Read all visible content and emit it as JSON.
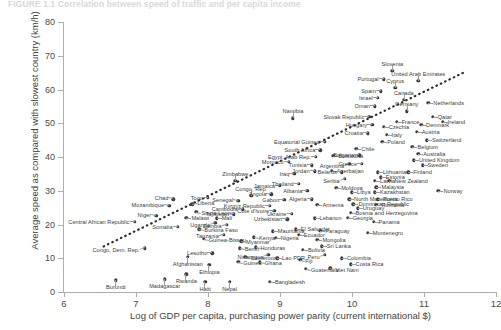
{
  "figure": {
    "title": "FIGURE 1.1  Correlation between speed of traffic and per capita income",
    "xlabel": "Log of GDP per capita, purchasing power parity (current international $)",
    "ylabel": "Average speed as compared with slowest country (km/h)"
  },
  "chart_data": {
    "type": "scatter",
    "title": "FIGURE 1.1  Correlation between speed of traffic and per capita income",
    "xlabel": "Log of GDP per capita, purchasing power parity (current international $)",
    "ylabel": "Average speed as compared with slowest country (km/h)",
    "xlim": [
      6,
      12
    ],
    "ylim": [
      0,
      80
    ],
    "xticks": [
      6,
      7,
      8,
      9,
      10,
      11,
      12
    ],
    "yticks": [
      0,
      10,
      20,
      30,
      40,
      50,
      60,
      70,
      80
    ],
    "grid": false,
    "legend": "none",
    "marker_color": "#3c3c3c",
    "trendline": {
      "style": "dotted",
      "x0": 6.55,
      "y0": 13.5,
      "x1": 11.55,
      "y1": 65.0
    },
    "points": [
      {
        "label": "Burundi",
        "x": 6.72,
        "y": 3.5,
        "side": "c",
        "dx": 0,
        "dy": 7
      },
      {
        "label": "Central African Republic",
        "x": 6.98,
        "y": 20.8,
        "side": "r",
        "dx": -5,
        "dy": 0,
        "two_line": true
      },
      {
        "label": "Congo, Dem. Rep.",
        "x": 7.12,
        "y": 13.0,
        "side": "r",
        "dx": -5,
        "dy": 2
      },
      {
        "label": "Niger",
        "x": 7.28,
        "y": 22.5,
        "side": "r",
        "dx": -5,
        "dy": -1
      },
      {
        "label": "Madagascar",
        "x": 7.4,
        "y": 3.8,
        "side": "c",
        "dx": 0,
        "dy": 7
      },
      {
        "label": "Mozambique",
        "x": 7.46,
        "y": 25.5,
        "side": "r",
        "dx": -5,
        "dy": -1
      },
      {
        "label": "Chad",
        "x": 7.52,
        "y": 27.5,
        "side": "r",
        "dx": -5,
        "dy": -1
      },
      {
        "label": "Somalia",
        "x": 7.58,
        "y": 19.3,
        "side": "r",
        "dx": -5,
        "dy": 0
      },
      {
        "label": "Malawi",
        "x": 7.7,
        "y": 22.0,
        "side": "l",
        "dx": 5,
        "dy": 0
      },
      {
        "label": "Afghanistan",
        "x": 7.72,
        "y": 10.5,
        "side": "c",
        "dx": 0,
        "dy": 7
      },
      {
        "label": "Liberia",
        "x": 7.78,
        "y": 26.0,
        "side": "l",
        "dx": 5,
        "dy": -1
      },
      {
        "label": "Sierra Leone",
        "x": 7.84,
        "y": 23.8,
        "side": "l",
        "dx": 5,
        "dy": 1,
        "two_line": true
      },
      {
        "label": "Burkina Faso",
        "x": 7.88,
        "y": 18.6,
        "side": "l",
        "dx": 5,
        "dy": 1
      },
      {
        "label": "Guinea-Bissau",
        "x": 7.94,
        "y": 15.7,
        "side": "l",
        "dx": 5,
        "dy": 1
      },
      {
        "label": "Haiti",
        "x": 7.96,
        "y": 3.0,
        "side": "c",
        "dx": 0,
        "dy": 7
      },
      {
        "label": "Rwanda",
        "x": 7.7,
        "y": 5.2,
        "side": "c",
        "dx": 0,
        "dy": 7
      },
      {
        "label": "Lesotho",
        "x": 8.06,
        "y": 11.5,
        "side": "r",
        "dx": -5,
        "dy": 0
      },
      {
        "label": "Ethiopia",
        "x": 8.02,
        "y": 8.0,
        "side": "c",
        "dx": 0,
        "dy": 7
      },
      {
        "label": "Togo",
        "x": 8.0,
        "y": 28.0,
        "side": "r",
        "dx": -5,
        "dy": 0
      },
      {
        "label": "Mali",
        "x": 8.12,
        "y": 21.8,
        "side": "l",
        "dx": 5,
        "dy": 0
      },
      {
        "label": "Uganda",
        "x": 8.1,
        "y": 20.5,
        "side": "r",
        "dx": -5,
        "dy": 2
      },
      {
        "label": "Nepal",
        "x": 8.3,
        "y": 3.0,
        "side": "c",
        "dx": 0,
        "dy": 7
      },
      {
        "label": "Zambia",
        "x": 8.26,
        "y": 20.0,
        "side": "r",
        "dx": -5,
        "dy": 1
      },
      {
        "label": "Tanzania",
        "x": 8.22,
        "y": 17.0,
        "side": "r",
        "dx": -5,
        "dy": 1
      },
      {
        "label": "Tajikistan",
        "x": 8.36,
        "y": 23.0,
        "side": "r",
        "dx": -5,
        "dy": 0
      },
      {
        "label": "Senegal",
        "x": 8.42,
        "y": 27.0,
        "side": "r",
        "dx": -5,
        "dy": -1
      },
      {
        "label": "Cambodia",
        "x": 8.48,
        "y": 24.5,
        "side": "r",
        "dx": -5,
        "dy": 0
      },
      {
        "label": "Myanmar",
        "x": 8.46,
        "y": 15.0,
        "side": "l",
        "dx": 5,
        "dy": 1
      },
      {
        "label": "Benin",
        "x": 8.44,
        "y": 13.0,
        "side": "l",
        "dx": 5,
        "dy": 1
      },
      {
        "label": "Cameroon",
        "x": 8.52,
        "y": 10.5,
        "side": "l",
        "dx": 5,
        "dy": 1
      },
      {
        "label": "Guinea",
        "x": 8.42,
        "y": 9.0,
        "side": "l",
        "dx": 5,
        "dy": 1
      },
      {
        "label": "Kenya",
        "x": 8.64,
        "y": 16.2,
        "side": "l",
        "dx": 5,
        "dy": 1
      },
      {
        "label": "Honduras",
        "x": 8.66,
        "y": 13.2,
        "side": "l",
        "dx": 5,
        "dy": 1
      },
      {
        "label": "Ghana",
        "x": 8.72,
        "y": 8.8,
        "side": "l",
        "dx": 5,
        "dy": 1
      },
      {
        "label": "Zimbabwe",
        "x": 8.38,
        "y": 33.0,
        "side": "c",
        "dx": 0,
        "dy": -7
      },
      {
        "label": "Congo, Rep.",
        "x": 8.6,
        "y": 28.5,
        "side": "c",
        "dx": 0,
        "dy": -7
      },
      {
        "label": "Bangladesh",
        "x": 8.86,
        "y": 3.0,
        "side": "l",
        "dx": 5,
        "dy": 0
      },
      {
        "label": "Nicaragua",
        "x": 8.84,
        "y": 11.0,
        "side": "r",
        "dx": -5,
        "dy": 2
      },
      {
        "label": "Lao PDR",
        "x": 8.96,
        "y": 10.0,
        "side": "l",
        "dx": 5,
        "dy": 0
      },
      {
        "label": "Nigeria",
        "x": 8.94,
        "y": 16.0,
        "side": "l",
        "dx": 5,
        "dy": 0
      },
      {
        "label": "Mauritania",
        "x": 8.9,
        "y": 18.0,
        "side": "l",
        "dx": 5,
        "dy": 0
      },
      {
        "label": "Angola",
        "x": 8.88,
        "y": 29.0,
        "side": "r",
        "dx": -5,
        "dy": 0
      },
      {
        "label": "Kyrgyz Republic",
        "x": 8.86,
        "y": 25.5,
        "side": "r",
        "dx": -5,
        "dy": 0
      },
      {
        "label": "Cote d'Ivoire",
        "x": 8.92,
        "y": 24.0,
        "side": "r",
        "dx": -5,
        "dy": 0
      },
      {
        "label": "Jamaica",
        "x": 9.0,
        "y": 31.5,
        "side": "r",
        "dx": -5,
        "dy": 0
      },
      {
        "label": "Gabon",
        "x": 9.06,
        "y": 27.3,
        "side": "r",
        "dx": -5,
        "dy": 0
      },
      {
        "label": "Uzbekistan",
        "x": 9.1,
        "y": 21.5,
        "side": "r",
        "dx": -5,
        "dy": 0
      },
      {
        "label": "Ukraine",
        "x": 9.16,
        "y": 23.2,
        "side": "r",
        "dx": -5,
        "dy": 0
      },
      {
        "label": "Fiji",
        "x": 9.28,
        "y": 9.5,
        "side": "l",
        "dx": 5,
        "dy": 1
      },
      {
        "label": "Bolivia",
        "x": 9.32,
        "y": 12.5,
        "side": "l",
        "dx": 5,
        "dy": 0
      },
      {
        "label": "Guatemala",
        "x": 9.36,
        "y": 6.8,
        "side": "l",
        "dx": 5,
        "dy": 1
      },
      {
        "label": "El Salvador",
        "x": 9.22,
        "y": 18.6,
        "side": "l",
        "dx": 5,
        "dy": 0
      },
      {
        "label": "Ecuador",
        "x": 9.26,
        "y": 17.0,
        "side": "l",
        "dx": 5,
        "dy": 0
      },
      {
        "label": "Morocco",
        "x": 9.12,
        "y": 38.5,
        "side": "r",
        "dx": -5,
        "dy": 0
      },
      {
        "label": "Iraq",
        "x": 9.2,
        "y": 35.0,
        "side": "r",
        "dx": -5,
        "dy": 0
      },
      {
        "label": "Thailand",
        "x": 9.26,
        "y": 32.0,
        "side": "r",
        "dx": -5,
        "dy": 0
      },
      {
        "label": "Albania",
        "x": 9.38,
        "y": 30.0,
        "side": "r",
        "dx": -5,
        "dy": 0
      },
      {
        "label": "Algeria",
        "x": 9.44,
        "y": 27.5,
        "side": "r",
        "dx": -5,
        "dy": 0
      },
      {
        "label": "Armenia",
        "x": 9.52,
        "y": 25.8,
        "side": "l",
        "dx": 5,
        "dy": 0
      },
      {
        "label": "Lebanon",
        "x": 9.48,
        "y": 21.8,
        "side": "l",
        "dx": 5,
        "dy": 0
      },
      {
        "label": "Paraguay",
        "x": 9.56,
        "y": 18.2,
        "side": "l",
        "dx": 5,
        "dy": 0
      },
      {
        "label": "Mongolia",
        "x": 9.52,
        "y": 15.5,
        "side": "l",
        "dx": 5,
        "dy": 0
      },
      {
        "label": "Sri Lanka",
        "x": 9.58,
        "y": 13.5,
        "side": "l",
        "dx": 5,
        "dy": 0
      },
      {
        "label": "Peru",
        "x": 9.62,
        "y": 11.0,
        "side": "r",
        "dx": -5,
        "dy": 2
      },
      {
        "label": "Viet Nam",
        "x": 9.7,
        "y": 7.0,
        "side": "l",
        "dx": 5,
        "dy": 2
      },
      {
        "label": "Colombia",
        "x": 9.86,
        "y": 10.0,
        "side": "l",
        "dx": 5,
        "dy": 0
      },
      {
        "label": "Costa Rica",
        "x": 9.98,
        "y": 8.2,
        "side": "l",
        "dx": 5,
        "dy": 0
      },
      {
        "label": "Namibia",
        "x": 9.18,
        "y": 51.5,
        "side": "c",
        "dx": 0,
        "dy": -7
      },
      {
        "label": "Equatorial Guinea",
        "x": 9.62,
        "y": 44.5,
        "side": "r",
        "dx": -5,
        "dy": 0
      },
      {
        "label": "South Africa",
        "x": 9.56,
        "y": 42.0,
        "side": "r",
        "dx": -5,
        "dy": 0
      },
      {
        "label": "Egypt, Arab Rep.",
        "x": 9.5,
        "y": 40.0,
        "side": "r",
        "dx": -5,
        "dy": 0
      },
      {
        "label": "Tunisia",
        "x": 9.44,
        "y": 37.5,
        "side": "r",
        "dx": -5,
        "dy": 0
      },
      {
        "label": "Jordan",
        "x": 9.48,
        "y": 35.8,
        "side": "r",
        "dx": -5,
        "dy": 0
      },
      {
        "label": "Botswana",
        "x": 9.74,
        "y": 40.3,
        "side": "l",
        "dx": 5,
        "dy": 0
      },
      {
        "label": "Azerbaijan",
        "x": 9.72,
        "y": 36.0,
        "side": "l",
        "dx": 5,
        "dy": 0
      },
      {
        "label": "Moldova",
        "x": 9.78,
        "y": 30.8,
        "side": "l",
        "dx": 5,
        "dy": 0
      },
      {
        "label": "Chile",
        "x": 10.06,
        "y": 42.5,
        "side": "l",
        "dx": 5,
        "dy": 0
      },
      {
        "label": "Argentina",
        "x": 9.96,
        "y": 38.0,
        "side": "r",
        "dx": -5,
        "dy": 2
      },
      {
        "label": "Serbia",
        "x": 9.9,
        "y": 33.5,
        "side": "r",
        "dx": -5,
        "dy": 2
      },
      {
        "label": "Belarus",
        "x": 9.86,
        "y": 35.5,
        "side": "r",
        "dx": -5,
        "dy": 0
      },
      {
        "label": "Libya",
        "x": 10.0,
        "y": 29.5,
        "side": "l",
        "dx": 5,
        "dy": 0
      },
      {
        "label": "North Macedonia",
        "x": 9.96,
        "y": 27.5,
        "side": "l",
        "dx": 5,
        "dy": 0
      },
      {
        "label": "Dominican Republic",
        "x": 10.02,
        "y": 26.0,
        "side": "l",
        "dx": 5,
        "dy": 0
      },
      {
        "label": "Bosnia and Herzegovina",
        "x": 9.98,
        "y": 23.5,
        "side": "l",
        "dx": 5,
        "dy": 0
      },
      {
        "label": "Georgia",
        "x": 9.94,
        "y": 22.0,
        "side": "l",
        "dx": 5,
        "dy": 0
      },
      {
        "label": "Uruguay",
        "x": 10.08,
        "y": 24.8,
        "side": "l",
        "dx": 5,
        "dy": 0
      },
      {
        "label": "Greece",
        "x": 10.14,
        "y": 38.0,
        "side": "r",
        "dx": -5,
        "dy": 0
      },
      {
        "label": "Bulgaria",
        "x": 10.1,
        "y": 40.5,
        "side": "r",
        "dx": -5,
        "dy": 0
      },
      {
        "label": "Latvia",
        "x": 10.32,
        "y": 33.0,
        "side": "l",
        "dx": 5,
        "dy": 0
      },
      {
        "label": "Malaysia",
        "x": 10.34,
        "y": 31.0,
        "side": "l",
        "dx": 5,
        "dy": 0
      },
      {
        "label": "Lithuania",
        "x": 10.36,
        "y": 35.5,
        "side": "l",
        "dx": 5,
        "dy": 0
      },
      {
        "label": "Estonia",
        "x": 10.4,
        "y": 34.0,
        "side": "l",
        "dx": 5,
        "dy": 0
      },
      {
        "label": "New Zealand",
        "x": 10.52,
        "y": 33.0,
        "side": "l",
        "dx": 5,
        "dy": 0
      },
      {
        "label": "Kazakhstan",
        "x": 10.32,
        "y": 29.5,
        "side": "l",
        "dx": 5,
        "dy": 0
      },
      {
        "label": "Puerto Rico",
        "x": 10.36,
        "y": 27.5,
        "side": "l",
        "dx": 5,
        "dy": 0
      },
      {
        "label": "Romania",
        "x": 10.34,
        "y": 25.8,
        "side": "l",
        "dx": 5,
        "dy": 0
      },
      {
        "label": "Panama",
        "x": 10.3,
        "y": 20.8,
        "side": "l",
        "dx": 5,
        "dy": 0
      },
      {
        "label": "Montenegro",
        "x": 10.22,
        "y": 17.5,
        "side": "l",
        "dx": 5,
        "dy": 0
      },
      {
        "label": "Norway",
        "x": 11.2,
        "y": 30.0,
        "side": "l",
        "dx": 5,
        "dy": 0
      },
      {
        "label": "Croatia",
        "x": 10.22,
        "y": 47.0,
        "side": "r",
        "dx": -5,
        "dy": 0
      },
      {
        "label": "Hungary",
        "x": 10.28,
        "y": 49.5,
        "side": "r",
        "dx": -5,
        "dy": 0
      },
      {
        "label": "Slovak Republic",
        "x": 10.24,
        "y": 52.0,
        "side": "r",
        "dx": -5,
        "dy": 0
      },
      {
        "label": "Czechia",
        "x": 10.44,
        "y": 49.0,
        "side": "l",
        "dx": 5,
        "dy": 0
      },
      {
        "label": "Italy",
        "x": 10.48,
        "y": 46.5,
        "side": "l",
        "dx": 5,
        "dy": 0
      },
      {
        "label": "Poland",
        "x": 10.42,
        "y": 44.5,
        "side": "l",
        "dx": 5,
        "dy": 0
      },
      {
        "label": "France",
        "x": 10.62,
        "y": 50.5,
        "side": "l",
        "dx": 5,
        "dy": 0
      },
      {
        "label": "Oman",
        "x": 10.32,
        "y": 55.0,
        "side": "r",
        "dx": -5,
        "dy": 0
      },
      {
        "label": "Israel",
        "x": 10.36,
        "y": 57.5,
        "side": "r",
        "dx": -5,
        "dy": 0
      },
      {
        "label": "Spain",
        "x": 10.4,
        "y": 59.5,
        "side": "r",
        "dx": -5,
        "dy": 0
      },
      {
        "label": "Portugal",
        "x": 10.44,
        "y": 63.0,
        "side": "r",
        "dx": -5,
        "dy": 0
      },
      {
        "label": "Slovenia",
        "x": 10.56,
        "y": 65.5,
        "side": "c",
        "dx": 0,
        "dy": -7
      },
      {
        "label": "Cyprus",
        "x": 10.6,
        "y": 60.5,
        "side": "c",
        "dx": 0,
        "dy": -7
      },
      {
        "label": "Canada",
        "x": 10.72,
        "y": 57.0,
        "side": "c",
        "dx": 0,
        "dy": -7
      },
      {
        "label": "Germany",
        "x": 10.76,
        "y": 53.5,
        "side": "c",
        "dx": 0,
        "dy": -7
      },
      {
        "label": "United Arab Emirates",
        "x": 10.92,
        "y": 62.5,
        "side": "c",
        "dx": 0,
        "dy": -7
      },
      {
        "label": "Netherlands",
        "x": 11.06,
        "y": 56.0,
        "side": "l",
        "dx": 5,
        "dy": 0
      },
      {
        "label": "Qatar",
        "x": 11.12,
        "y": 52.0,
        "side": "l",
        "dx": 5,
        "dy": 0
      },
      {
        "label": "Ireland",
        "x": 11.26,
        "y": 50.5,
        "side": "l",
        "dx": 5,
        "dy": 0
      },
      {
        "label": "Denmark",
        "x": 10.96,
        "y": 49.5,
        "side": "l",
        "dx": 5,
        "dy": 0
      },
      {
        "label": "Austria",
        "x": 10.9,
        "y": 47.5,
        "side": "l",
        "dx": 5,
        "dy": 0
      },
      {
        "label": "Switzerland",
        "x": 11.04,
        "y": 45.0,
        "side": "l",
        "dx": 5,
        "dy": 0
      },
      {
        "label": "Belgium",
        "x": 10.84,
        "y": 43.0,
        "side": "l",
        "dx": 5,
        "dy": 0
      },
      {
        "label": "Australia",
        "x": 10.92,
        "y": 41.0,
        "side": "l",
        "dx": 5,
        "dy": 0
      },
      {
        "label": "United Kingdom",
        "x": 10.86,
        "y": 39.0,
        "side": "l",
        "dx": 5,
        "dy": 0
      },
      {
        "label": "Sweden",
        "x": 10.98,
        "y": 37.5,
        "side": "l",
        "dx": 5,
        "dy": 0
      },
      {
        "label": "Finland",
        "x": 10.78,
        "y": 35.5,
        "side": "l",
        "dx": 5,
        "dy": 0
      }
    ]
  }
}
